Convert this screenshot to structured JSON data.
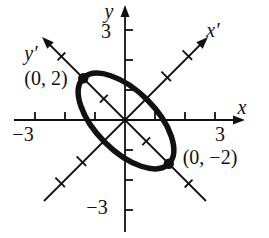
{
  "figure": {
    "background_color": "#ffffff",
    "ink_color": "#111111",
    "axes": {
      "x": {
        "label": "x",
        "neg_tick_label": "−3",
        "pos_tick_label": "3"
      },
      "y": {
        "label": "y",
        "pos_tick_label": "3",
        "neg_tick_label": "−3"
      },
      "x_prime": {
        "label": "x′"
      },
      "y_prime": {
        "label": "y′"
      }
    },
    "points": [
      {
        "label": "(0, 2)",
        "on_axis": "y′"
      },
      {
        "label": "(0, −2)",
        "on_axis": "y′"
      }
    ],
    "ellipse": {
      "center_xy": [
        0,
        0
      ],
      "rotation_deg": 45,
      "semi_major_units": 2,
      "semi_minor_units": 1,
      "major_axis_along": "y′"
    },
    "tick_units": [
      -3,
      -2,
      -1,
      1,
      2,
      3
    ]
  }
}
